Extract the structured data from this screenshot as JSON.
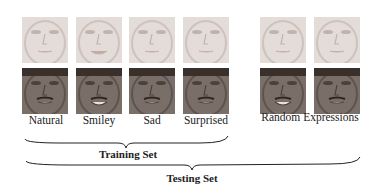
{
  "figure": {
    "columns": [
      {
        "label": "Natural"
      },
      {
        "label": "Smiley"
      },
      {
        "label": "Sad"
      },
      {
        "label": "Surprised"
      }
    ],
    "random_label": "Random Expressions",
    "training_label": "Training Set",
    "testing_label": "Testing Set",
    "subjects": [
      {
        "name": "female-subject",
        "skin": "#e4dcd8",
        "shade": "#bfb3ad"
      },
      {
        "name": "male-subject",
        "skin": "#7a6f68",
        "shade": "#4c423c"
      }
    ]
  }
}
